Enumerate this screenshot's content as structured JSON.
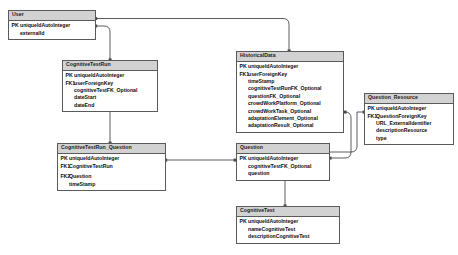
{
  "diagram": {
    "style": {
      "header_fill": "#d2d2d2",
      "box_fill": "#ffffff",
      "border_color": "#5a5a5a",
      "line_color": "#4a4a4a",
      "text_color": "#0d0d0d"
    }
  },
  "entities": {
    "user": {
      "name": "User",
      "fields": [
        {
          "key": "PK",
          "name": "uniqueIdAutoInteger"
        },
        {
          "key": "",
          "name": "externalId"
        }
      ]
    },
    "cognitive_test_run": {
      "name": "CognitiveTestRun",
      "fields": [
        {
          "key": "PK",
          "name": "uniqueIdAutoInteger"
        },
        {
          "key": "FK1",
          "name": "userForeignKey"
        },
        {
          "key": "",
          "name": "cognitiveTestFK_Optional"
        },
        {
          "key": "",
          "name": "dateStart"
        },
        {
          "key": "",
          "name": "dateEnd"
        }
      ]
    },
    "historical_data": {
      "name": "HistoricalData",
      "fields": [
        {
          "key": "PK",
          "name": "uniqueIdAutoInteger"
        },
        {
          "key": "FK1",
          "name": "userForeignKey"
        },
        {
          "key": "",
          "name": "timeStamp"
        },
        {
          "key": "",
          "name": "cognitiveTestRunFK_Optional"
        },
        {
          "key": "",
          "name": "questionFK_Optional"
        },
        {
          "key": "",
          "name": "crowdWorkPlatform_Optional"
        },
        {
          "key": "",
          "name": "crowdWorkTask_Optional"
        },
        {
          "key": "",
          "name": "adaptationElement_Optional"
        },
        {
          "key": "",
          "name": "adaptationResult_Optional"
        }
      ]
    },
    "question_resource": {
      "name": "Question_Resource",
      "fields": [
        {
          "key": "PK",
          "name": "uniqueIdAutoInteger"
        },
        {
          "key": "FK1",
          "name": "QuestionForeignKey"
        },
        {
          "key": "",
          "name": "URL_ExternalIdentifier"
        },
        {
          "key": "",
          "name": "descriptionResource"
        },
        {
          "key": "",
          "name": "type"
        }
      ]
    },
    "cognitive_test_run_question": {
      "name": "CognitiveTestRun_Question",
      "fields": [
        {
          "key": "PK",
          "name": "uniqueIdAutoInteger"
        },
        {
          "key": "FK1",
          "name": "CognitiveTestRun"
        },
        {
          "key": "FK2",
          "name": "Question"
        },
        {
          "key": "",
          "name": "timeStamp"
        }
      ]
    },
    "question": {
      "name": "Question",
      "fields": [
        {
          "key": "PK",
          "name": "uniqueIdAutoInteger"
        },
        {
          "key": "",
          "name": "cognitiveTestFK_Optional"
        },
        {
          "key": "",
          "name": "question"
        }
      ]
    },
    "cognitive_test": {
      "name": "CognitiveTest",
      "fields": [
        {
          "key": "PK",
          "name": "uniqueIdAutoInteger"
        },
        {
          "key": "",
          "name": "nameCognitiveTest"
        },
        {
          "key": "",
          "name": "descriptionCognitiveTest"
        }
      ]
    }
  },
  "relationships": [
    {
      "from": "user",
      "to": "historical_data",
      "label": ""
    },
    {
      "from": "user",
      "to": "cognitive_test_run",
      "label": ""
    },
    {
      "from": "cognitive_test_run",
      "to": "cognitive_test_run_question",
      "label": ""
    },
    {
      "from": "cognitive_test_run_question",
      "to": "question",
      "label": ""
    },
    {
      "from": "historical_data",
      "to": "question",
      "label": ""
    },
    {
      "from": "question",
      "to": "question_resource",
      "label": ""
    },
    {
      "from": "question",
      "to": "cognitive_test",
      "label": ""
    }
  ]
}
